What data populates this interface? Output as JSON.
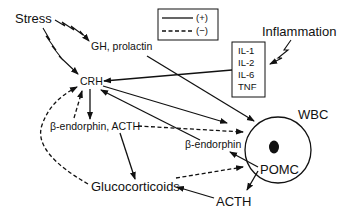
{
  "nodes": {
    "stress": "Stress",
    "gh_prolactin": "GH, prolactin",
    "crh": "CRH",
    "inflammation": "Inflammation",
    "cytokines": [
      "IL-1",
      "IL-2",
      "IL-6",
      "TNF"
    ],
    "beta_endorphin_acth": "β-endorphin, ACTH",
    "glucocorticoids": "Glucocorticoids",
    "wbc": "WBC",
    "beta_endorphin": "β-endorphin",
    "pomc": "POMC",
    "acth": "ACTH"
  },
  "legend": {
    "positive": "(+)",
    "negative": "(−)"
  }
}
